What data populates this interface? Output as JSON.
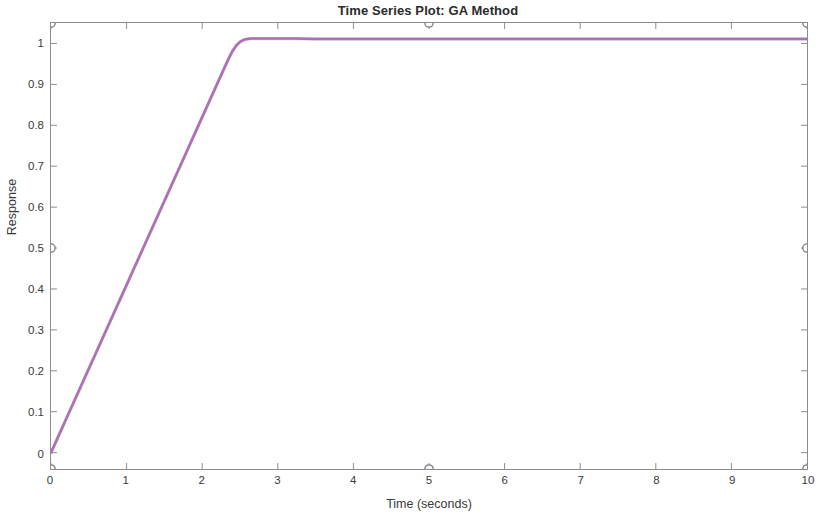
{
  "chart_data": {
    "type": "line",
    "title": "Time Series Plot: GA Method",
    "xlabel": "Time (seconds)",
    "ylabel": "Response",
    "xlim": [
      0,
      10
    ],
    "ylim": [
      -0.04,
      1.05
    ],
    "grid": false,
    "legend": null,
    "line_color": "#b06fb0",
    "marker_color": "#7a7a85",
    "axis_color": "#8c8c90",
    "xticks": [
      0,
      1,
      2,
      3,
      4,
      5,
      6,
      7,
      8,
      9,
      10
    ],
    "xtick_labels": [
      "0",
      "1",
      "2",
      "3",
      "4",
      "5",
      "6",
      "7",
      "8",
      "9",
      "10"
    ],
    "yticks": [
      0,
      0.1,
      0.2,
      0.3,
      0.4,
      0.5,
      0.6,
      0.7,
      0.8,
      0.9,
      1
    ],
    "ytick_labels": [
      "0",
      "0.1",
      "0.2",
      "0.3",
      "0.4",
      "0.5",
      "0.6",
      "0.7",
      "0.8",
      "0.9",
      "1"
    ],
    "series": [
      {
        "name": "GA Method Response",
        "x": [
          0.0,
          0.1,
          0.2,
          0.3,
          0.4,
          0.5,
          0.6,
          0.7,
          0.8,
          0.9,
          1.0,
          1.1,
          1.2,
          1.3,
          1.4,
          1.5,
          1.6,
          1.7,
          1.8,
          1.9,
          2.0,
          2.1,
          2.2,
          2.3,
          2.35,
          2.4,
          2.45,
          2.5,
          2.55,
          2.6,
          2.65,
          2.7,
          2.8,
          2.9,
          3.0,
          3.2,
          3.5,
          4.0,
          4.5,
          5.0,
          5.5,
          6.0,
          6.5,
          7.0,
          7.5,
          8.0,
          8.5,
          9.0,
          9.5,
          10.0
        ],
        "y": [
          0.0,
          0.041,
          0.082,
          0.123,
          0.164,
          0.205,
          0.246,
          0.287,
          0.328,
          0.369,
          0.41,
          0.451,
          0.492,
          0.533,
          0.574,
          0.615,
          0.656,
          0.697,
          0.738,
          0.779,
          0.82,
          0.861,
          0.902,
          0.943,
          0.963,
          0.981,
          0.995,
          1.004,
          1.009,
          1.011,
          1.012,
          1.012,
          1.012,
          1.012,
          1.012,
          1.012,
          1.011,
          1.011,
          1.011,
          1.011,
          1.011,
          1.011,
          1.011,
          1.011,
          1.011,
          1.011,
          1.011,
          1.011,
          1.011,
          1.011
        ]
      }
    ],
    "border_markers": [
      {
        "label": "marker-top-left",
        "x": 0,
        "y": 1.05
      },
      {
        "label": "marker-top-mid",
        "x": 5,
        "y": 1.05
      },
      {
        "label": "marker-top-right",
        "x": 10,
        "y": 1.05
      },
      {
        "label": "marker-left-half",
        "x": 0,
        "y": 0.5
      },
      {
        "label": "marker-right-half",
        "x": 10,
        "y": 0.5
      },
      {
        "label": "marker-bottom-left",
        "x": 0,
        "y": -0.04
      },
      {
        "label": "marker-bottom-mid",
        "x": 5,
        "y": -0.04
      },
      {
        "label": "marker-bottom-right",
        "x": 10,
        "y": -0.04
      }
    ]
  }
}
